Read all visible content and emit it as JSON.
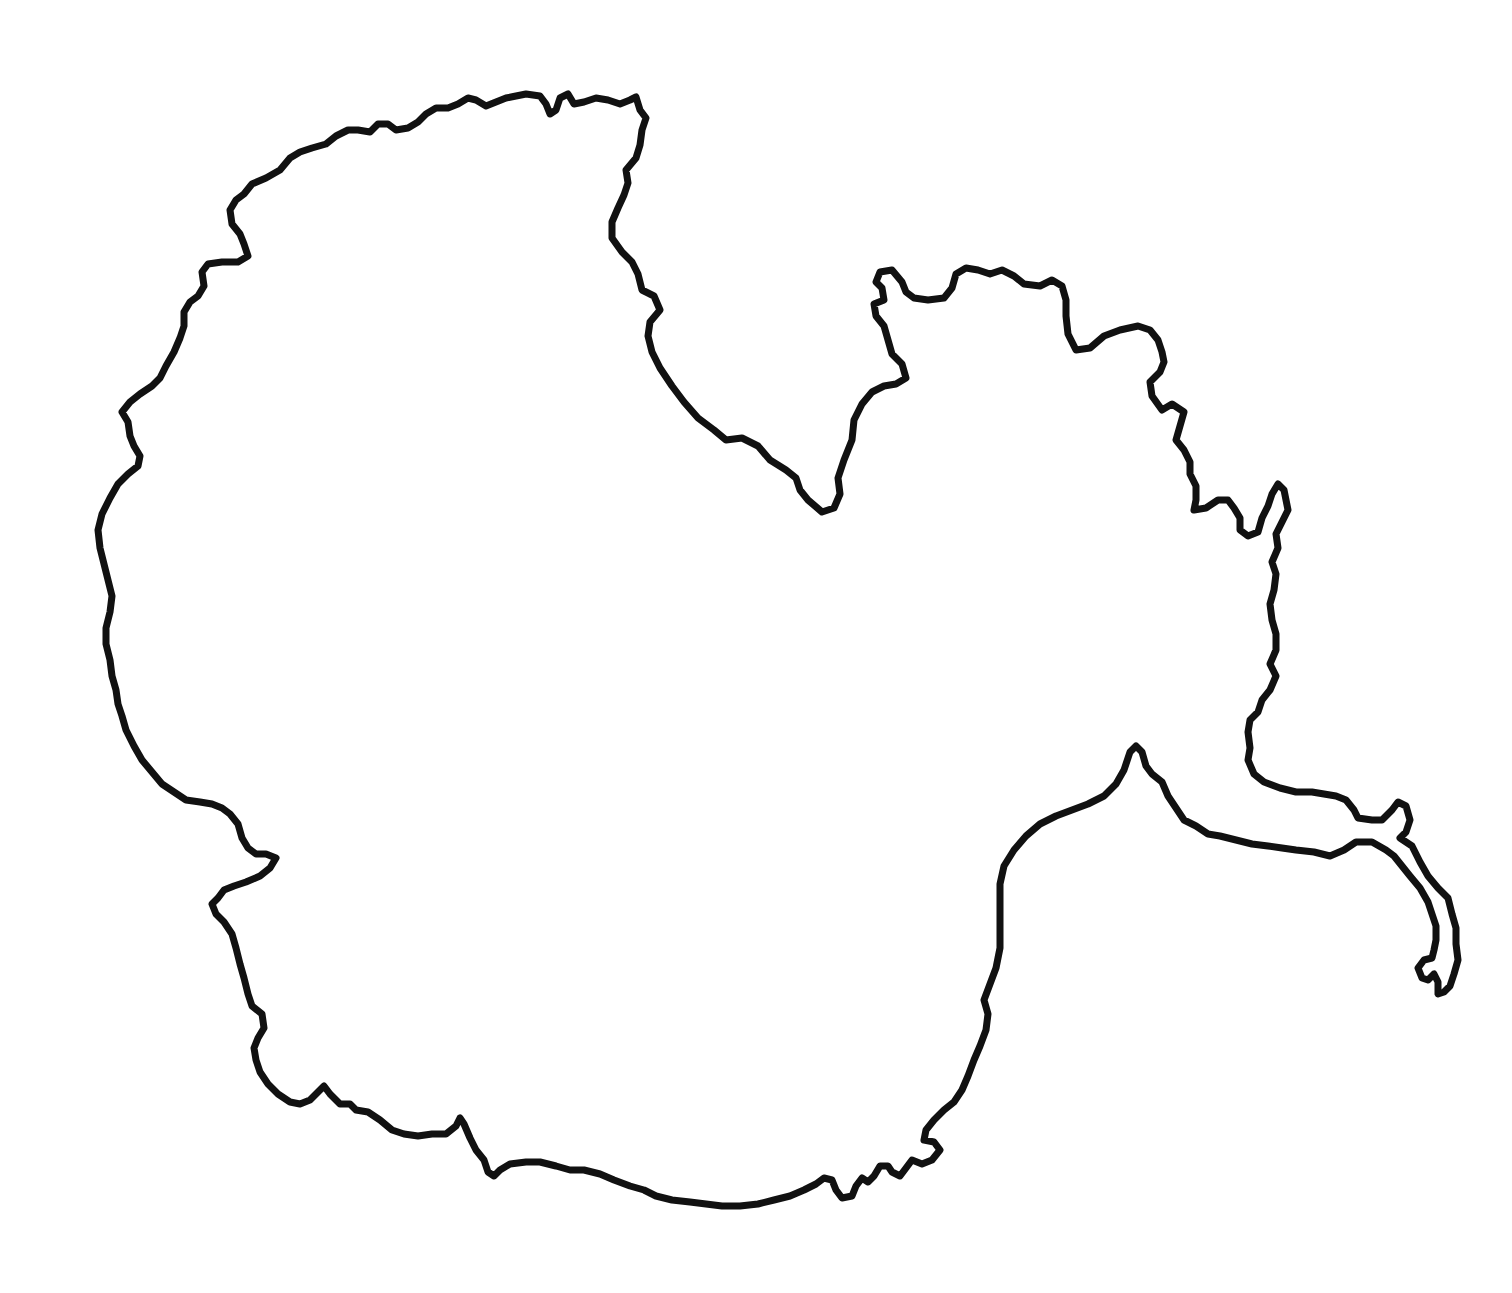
{
  "map": {
    "type": "outline",
    "subject": "continent-outline",
    "background": "#ffffff",
    "stroke_color": "#111111",
    "labels": []
  }
}
